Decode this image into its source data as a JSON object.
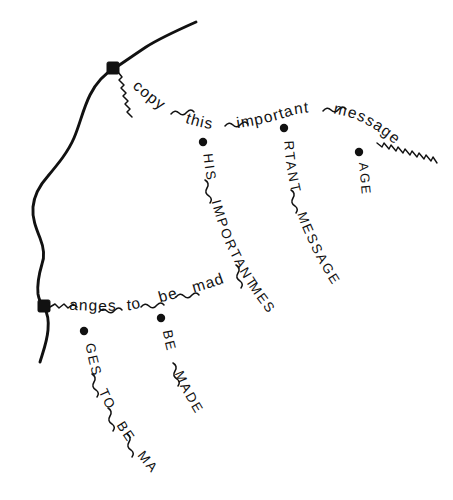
{
  "figure": {
    "background_color": "#ffffff",
    "ink_color": "#111111",
    "width": 453,
    "height": 500
  },
  "trunk": {
    "name": "main-contour-curve",
    "description": "Thick freehand contour running from upper right, through the upper square node, down the left side, through the lower square node, and off the bottom left"
  },
  "nodes": [
    {
      "id": "node-upper",
      "shape": "square",
      "x": 113,
      "y": 68
    },
    {
      "id": "node-lower",
      "shape": "square",
      "x": 44,
      "y": 306
    }
  ],
  "branches": [
    {
      "id": "branch-copy-this-important-message",
      "anchor": "node-upper",
      "case": "lower",
      "words": [
        "copy",
        "this",
        "important",
        "message"
      ],
      "text": "copy~this~important~message",
      "has_trailing_wave": true
    },
    {
      "id": "branch-anges-to-be-made",
      "anchor": "node-lower",
      "case": "lower",
      "words": [
        "anges",
        "to",
        "be",
        "made"
      ],
      "text": "anges~to~be~made",
      "has_trailing_wave": false
    }
  ],
  "sub_branches": [
    {
      "id": "sub-his-important-message",
      "dot": {
        "x": 203,
        "y": 142
      },
      "case": "upper",
      "text": "HIS~IMPORTANT~MESSAGE",
      "words": [
        "HIS",
        "IMPORTANT",
        "MESSAGE"
      ]
    },
    {
      "id": "sub-rtant-message",
      "dot": {
        "x": 284,
        "y": 128
      },
      "case": "upper",
      "text": "RTANT~MESSAGE",
      "words": [
        "RTANT",
        "MESSAGE"
      ]
    },
    {
      "id": "sub-age",
      "dot": {
        "x": 359,
        "y": 152
      },
      "case": "upper",
      "text": "AGE",
      "words": [
        "AGE"
      ]
    },
    {
      "id": "sub-ges-to-be-made",
      "dot": {
        "x": 84,
        "y": 331
      },
      "case": "upper",
      "text": "GES~TO~BE~MADE",
      "words": [
        "GES",
        "TO",
        "BE",
        "MADE"
      ]
    },
    {
      "id": "sub-be-made",
      "dot": {
        "x": 161,
        "y": 318
      },
      "case": "upper",
      "text": "BE~MADE",
      "words": [
        "BE",
        "MADE"
      ]
    }
  ],
  "labels": {
    "copy": "copy",
    "this": "this",
    "important": "important",
    "message": "message",
    "anges": "anges",
    "to": "to",
    "be": "be",
    "made": "made",
    "his_important_message": "HIS~IMPORTANT~MESSAGE",
    "rtant_message": "RTANT~MESSAGE",
    "age": "AGE",
    "ges_to_be_made": "GES~TO~BE~MADE",
    "be_made": "BE~MADE"
  }
}
